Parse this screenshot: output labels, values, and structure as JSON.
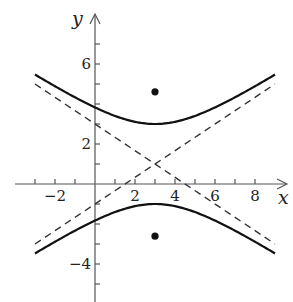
{
  "chart_data": {
    "type": "line",
    "title": "",
    "xlabel": "x",
    "ylabel": "y",
    "equation": "(y-1)^2/4 - (x-3)^2/9 = 1",
    "xlim": [
      -4,
      9.6
    ],
    "ylim": [
      -5.9,
      8.5
    ],
    "grid": false,
    "x_tick_labels": [
      "-2",
      "2",
      "4",
      "6",
      "8"
    ],
    "x_ticks": [
      -3,
      -2,
      -1,
      1,
      2,
      3,
      4,
      5,
      6,
      7,
      8
    ],
    "y_tick_labels": [
      "6",
      "2",
      "-4"
    ],
    "y_tick_labels_values": [
      6,
      2,
      -4
    ],
    "y_ticks": [
      -5,
      -4,
      -3,
      -2,
      -1,
      1,
      2,
      3,
      4,
      5,
      6,
      7
    ],
    "center": [
      3,
      1
    ],
    "vertices": [
      [
        3,
        3
      ],
      [
        3,
        -1
      ]
    ],
    "foci": [
      [
        3,
        4.61
      ],
      [
        3,
        -2.61
      ]
    ],
    "series": [
      {
        "name": "upper branch",
        "style": "solid",
        "x": [
          -3,
          -2,
          -1,
          0,
          1,
          2,
          3,
          4,
          5,
          6,
          7,
          8,
          9
        ],
        "y": [
          5.47,
          4.89,
          4.33,
          3.83,
          3.4,
          3.11,
          3.0,
          3.11,
          3.4,
          3.83,
          4.33,
          4.89,
          5.47
        ]
      },
      {
        "name": "lower branch",
        "style": "solid",
        "x": [
          -3,
          -2,
          -1,
          0,
          1,
          2,
          3,
          4,
          5,
          6,
          7,
          8,
          9
        ],
        "y": [
          -3.47,
          -2.89,
          -2.33,
          -1.83,
          -1.4,
          -1.11,
          -1.0,
          -1.11,
          -1.4,
          -1.83,
          -2.33,
          -2.89,
          -3.47
        ]
      },
      {
        "name": "asymptote y = 1 + (2/3)(x-3)",
        "style": "dashed",
        "x": [
          -3,
          9
        ],
        "y": [
          -3,
          5
        ]
      },
      {
        "name": "asymptote y = 1 - (2/3)(x-3)",
        "style": "dashed",
        "x": [
          -3,
          9
        ],
        "y": [
          5,
          -3
        ]
      },
      {
        "name": "foci",
        "style": "points",
        "x": [
          3,
          3
        ],
        "y": [
          4.61,
          -2.61
        ]
      }
    ]
  },
  "labels": {
    "x_axis": "x",
    "y_axis": "y",
    "x_ticks": [
      {
        "value": -2,
        "text": "−2"
      },
      {
        "value": 2,
        "text": "2"
      },
      {
        "value": 4,
        "text": "4"
      },
      {
        "value": 6,
        "text": "6"
      },
      {
        "value": 8,
        "text": "8"
      }
    ],
    "y_ticks": [
      {
        "value": 6,
        "text": "6"
      },
      {
        "value": 2,
        "text": "2"
      },
      {
        "value": -4,
        "text": "−4"
      }
    ]
  }
}
